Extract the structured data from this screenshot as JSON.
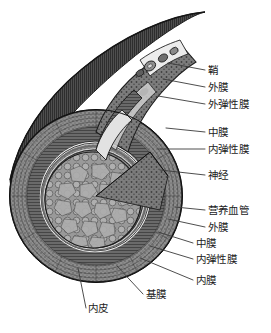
{
  "figure": {
    "width": 271,
    "height": 333,
    "background_color": "#ffffff",
    "ink_color": "#1c1c1c",
    "leader_color": "#3a3a3a"
  },
  "labels": [
    {
      "id": "sheath",
      "text": "鞘",
      "x": 208,
      "y": 72,
      "anchor_x": 168,
      "anchor_y": 63,
      "group": "right"
    },
    {
      "id": "adventitia-upper",
      "text": "外膜",
      "x": 208,
      "y": 89,
      "anchor_x": 163,
      "anchor_y": 78,
      "group": "right"
    },
    {
      "id": "external-elastic",
      "text": "外弹性膜",
      "x": 208,
      "y": 106,
      "anchor_x": 160,
      "anchor_y": 94,
      "group": "right"
    },
    {
      "id": "media-upper",
      "text": "中膜",
      "x": 208,
      "y": 134,
      "anchor_x": 163,
      "anchor_y": 129,
      "group": "right"
    },
    {
      "id": "internal-elastic-u",
      "text": "内弹性膜",
      "x": 208,
      "y": 151,
      "anchor_x": 158,
      "anchor_y": 148,
      "group": "right"
    },
    {
      "id": "nerve",
      "text": "神经",
      "x": 208,
      "y": 177,
      "anchor_x": 161,
      "anchor_y": 170,
      "group": "right"
    },
    {
      "id": "vasa-vasorum",
      "text": "营养血管",
      "x": 208,
      "y": 212,
      "anchor_x": 172,
      "anchor_y": 208,
      "group": "right"
    },
    {
      "id": "adventitia-lower",
      "text": "外膜",
      "x": 208,
      "y": 229,
      "anchor_x": 170,
      "anchor_y": 220,
      "group": "right"
    },
    {
      "id": "media-lower",
      "text": "中膜",
      "x": 196,
      "y": 245,
      "anchor_x": 160,
      "anchor_y": 233,
      "group": "right"
    },
    {
      "id": "internal-elastic-l",
      "text": "内弹性膜",
      "x": 196,
      "y": 261,
      "anchor_x": 152,
      "anchor_y": 247,
      "group": "right"
    },
    {
      "id": "intima",
      "text": "内膜",
      "x": 196,
      "y": 282,
      "anchor_x": 140,
      "anchor_y": 259,
      "group": "bottom"
    },
    {
      "id": "basement-membrane",
      "text": "基膜",
      "x": 146,
      "y": 296,
      "anchor_x": 118,
      "anchor_y": 265,
      "group": "bottom"
    },
    {
      "id": "endothelium",
      "text": "内皮",
      "x": 88,
      "y": 310,
      "anchor_x": 80,
      "anchor_y": 268,
      "group": "bottom"
    }
  ],
  "structures": {
    "sheath": "鞘",
    "adventitia": "外膜",
    "external_elastic_membrane": "外弹性膜",
    "media": "中膜",
    "internal_elastic_membrane": "内弹性膜",
    "nerve": "神经",
    "vasa_vasorum": "营养血管",
    "intima": "内膜",
    "basement_membrane": "基膜",
    "endothelium": "内皮"
  }
}
